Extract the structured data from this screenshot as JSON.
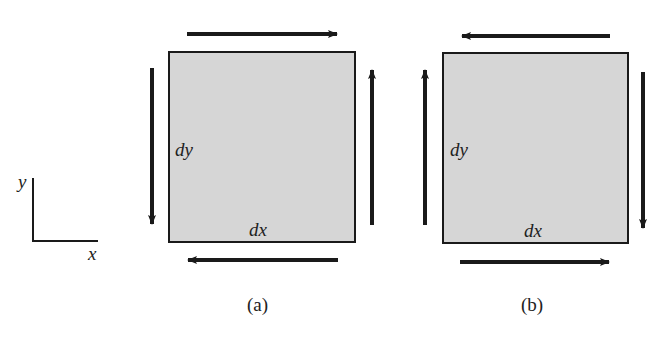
{
  "axes": {
    "x_label": "x",
    "y_label": "y"
  },
  "panels": [
    {
      "caption": "(a)",
      "dx_label": "dx",
      "dy_label": "dy",
      "arrows": {
        "top": "right",
        "bottom": "left",
        "left": "down",
        "right": "up"
      }
    },
    {
      "caption": "(b)",
      "dx_label": "dx",
      "dy_label": "dy",
      "arrows": {
        "top": "left",
        "bottom": "right",
        "left": "up",
        "right": "down"
      }
    }
  ],
  "colors": {
    "fill": "#d6d6d6",
    "stroke": "#1a1a1a"
  }
}
